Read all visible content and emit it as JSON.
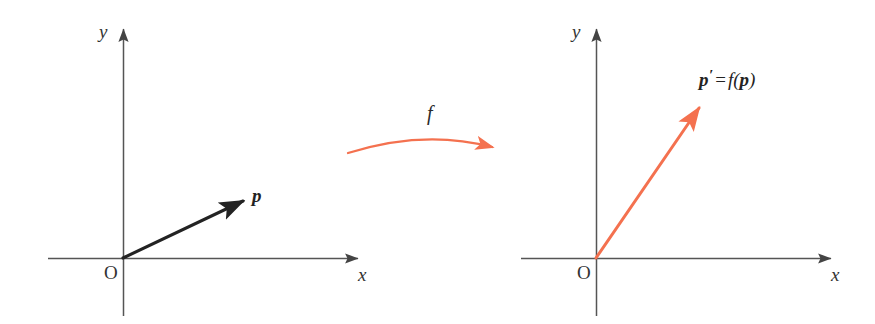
{
  "figure": {
    "background_color": "#ffffff",
    "axis_color": "#555555",
    "vector_color_source": "#2b2b2b",
    "vector_color_image": "#f4714f",
    "map_arrow_color": "#f28268"
  },
  "left_panel": {
    "name": "source-plane",
    "y_axis_label": "y",
    "x_axis_label": "x",
    "origin_label": "O",
    "vector": {
      "label": "p",
      "color": "#2b2b2b",
      "origin": [
        123,
        258
      ],
      "tip": [
        246,
        199
      ]
    }
  },
  "mapping": {
    "label": "f",
    "arrow_color": "#f28268",
    "start": [
      348,
      152
    ],
    "end": [
      499,
      146
    ]
  },
  "right_panel": {
    "name": "image-plane",
    "y_axis_label": "y",
    "x_axis_label": "x",
    "origin_label": "O",
    "vector": {
      "label_parts": {
        "p_prime": "p",
        "prime": "′",
        "equals": "=",
        "f": "f",
        "open": "(",
        "arg": "p",
        "close": ")"
      },
      "label_text": "p′ = f(p)",
      "color": "#f4714f",
      "origin": [
        596,
        258
      ],
      "tip": [
        702,
        104
      ]
    }
  }
}
